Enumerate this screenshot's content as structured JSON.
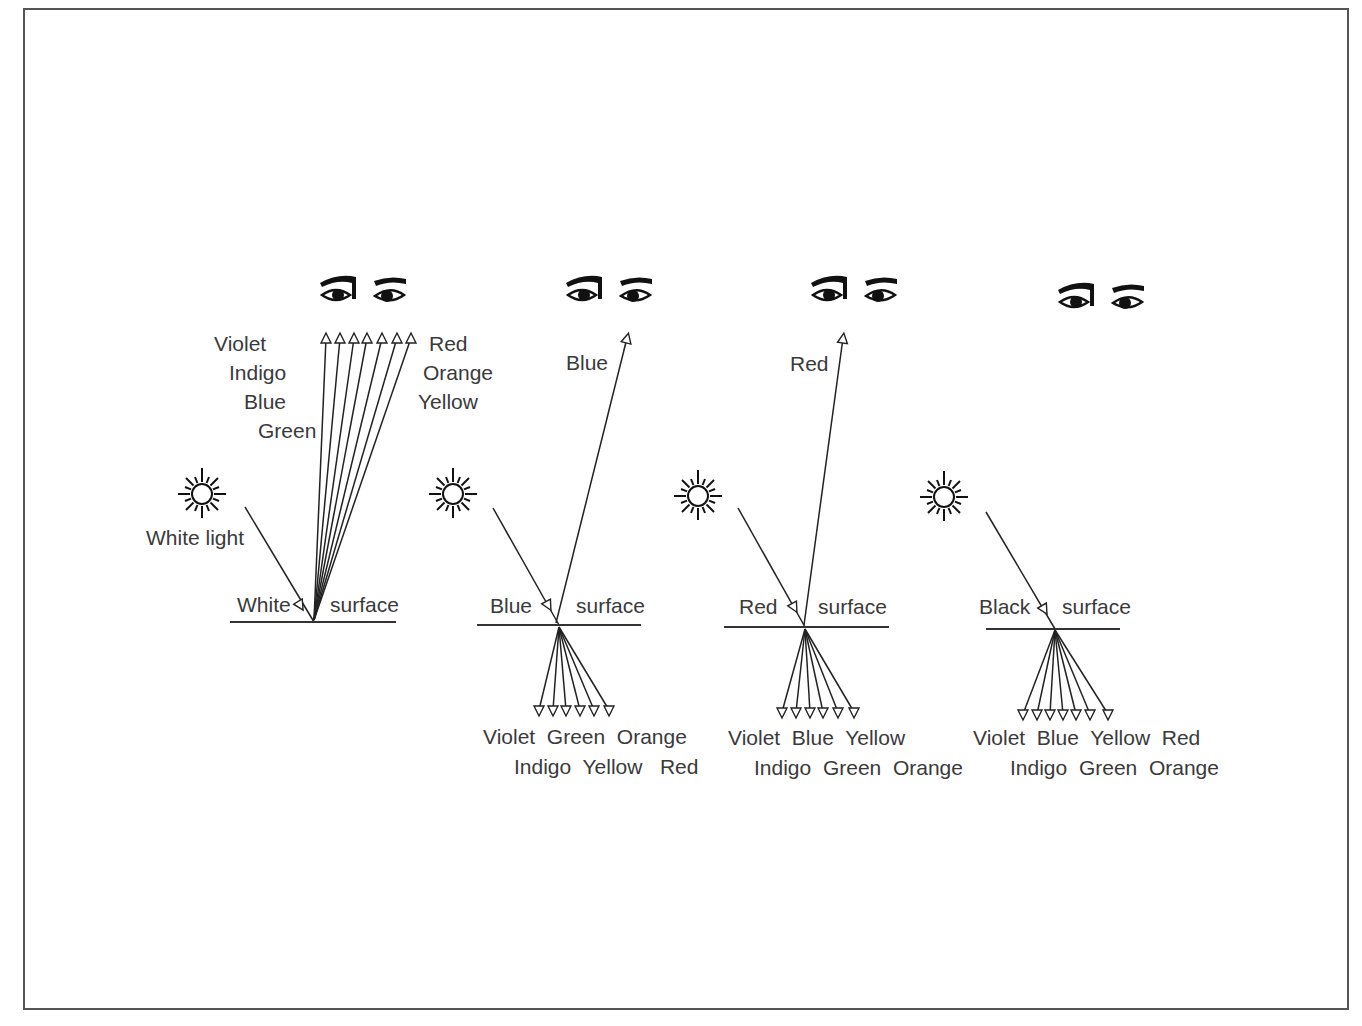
{
  "diagram": {
    "panels": [
      {
        "id": "white",
        "surface_label": "White",
        "surface_word": "surface",
        "incoming_label": "White light",
        "reflected": [
          "Violet",
          "Indigo",
          "Blue",
          "Green",
          "Yellow",
          "Orange",
          "Red"
        ],
        "reflected_labels_left": [
          "Violet",
          "Indigo",
          "Blue",
          "Green"
        ],
        "reflected_labels_right": [
          "Red",
          "Orange",
          "Yellow"
        ],
        "absorbed": [],
        "absorbed_row1": "",
        "absorbed_row2": ""
      },
      {
        "id": "blue",
        "surface_label": "Blue",
        "surface_word": "surface",
        "reflected": [
          "Blue"
        ],
        "reflected_label": "Blue",
        "absorbed": [
          "Violet",
          "Indigo",
          "Green",
          "Yellow",
          "Orange",
          "Red"
        ],
        "absorbed_row1": "Violet  Green  Orange",
        "absorbed_row2": "Indigo  Yellow   Red"
      },
      {
        "id": "red",
        "surface_label": "Red",
        "surface_word": "surface",
        "reflected": [
          "Red"
        ],
        "reflected_label": "Red",
        "absorbed": [
          "Violet",
          "Indigo",
          "Blue",
          "Green",
          "Yellow",
          "Orange"
        ],
        "absorbed_row1": "Violet  Blue  Yellow",
        "absorbed_row2": "Indigo  Green  Orange"
      },
      {
        "id": "black",
        "surface_label": "Black",
        "surface_word": "surface",
        "reflected": [],
        "absorbed": [
          "Violet",
          "Indigo",
          "Blue",
          "Green",
          "Yellow",
          "Orange",
          "Red"
        ],
        "absorbed_row1": "Violet  Blue  Yellow  Red",
        "absorbed_row2": "Indigo  Green  Orange"
      }
    ],
    "icons": {
      "light_source": "sun-icon",
      "observer": "eyes-icon"
    },
    "colors": {
      "ink": "#222222",
      "label": "#3a3a3a",
      "frame": "#555555",
      "background": "#ffffff"
    }
  }
}
